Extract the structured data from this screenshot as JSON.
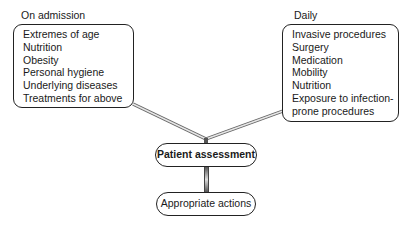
{
  "left_group": {
    "heading": "On admission",
    "items": [
      "Extremes of age",
      "Nutrition",
      "Obesity",
      "Personal hygiene",
      "Underlying diseases",
      "Treatments for above"
    ]
  },
  "right_group": {
    "heading": "Daily",
    "items": [
      "Invasive procedures",
      "Surgery",
      "Medication",
      "Mobility",
      "Nutrition",
      "Exposure to infection-",
      "prone procedures"
    ]
  },
  "center": {
    "assessment": "Patient assessment",
    "actions": "Appropriate actions"
  }
}
